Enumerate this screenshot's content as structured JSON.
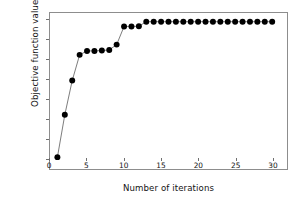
{
  "chart_data": {
    "type": "line",
    "title": "",
    "subtitle": "",
    "xlabel": "Number of iterations",
    "ylabel": "Objective function values",
    "xlim": [
      0,
      32
    ],
    "ylim": [
      0.2045,
      0.2835
    ],
    "xticks": [
      0,
      5,
      10,
      15,
      20,
      25,
      30
    ],
    "xticklabels": [
      "0",
      "5",
      "10",
      "15",
      "20",
      "25",
      "30"
    ],
    "yticks": [
      0.21,
      0.22,
      0.23,
      0.24,
      0.25,
      0.26,
      0.27,
      0.28
    ],
    "yticklabels": [
      "0.21",
      "0.22",
      "0.23",
      "0.24",
      "0.25",
      "0.26",
      "0.27",
      "0.28"
    ],
    "grid": false,
    "legend": false,
    "legend_position": "none",
    "marker": "filled-circle",
    "marker_color": "#000000",
    "line_color": "#5a5a5a",
    "x": [
      1,
      2,
      3,
      4,
      5,
      6,
      7,
      8,
      9,
      10,
      11,
      12,
      13,
      14,
      15,
      16,
      17,
      18,
      19,
      20,
      21,
      22,
      23,
      24,
      25,
      26,
      27,
      28,
      29,
      30
    ],
    "values": [
      0.2105,
      0.232,
      0.2493,
      0.2623,
      0.2643,
      0.2643,
      0.2645,
      0.2648,
      0.2675,
      0.2767,
      0.2767,
      0.2768,
      0.2791,
      0.2791,
      0.2791,
      0.2791,
      0.2791,
      0.2791,
      0.2791,
      0.2791,
      0.2791,
      0.2791,
      0.2791,
      0.2791,
      0.2791,
      0.2791,
      0.2791,
      0.2791,
      0.2791,
      0.2791
    ],
    "series": [
      {
        "name": "Objective function value",
        "values": [
          0.2105,
          0.232,
          0.2493,
          0.2623,
          0.2643,
          0.2643,
          0.2645,
          0.2648,
          0.2675,
          0.2767,
          0.2767,
          0.2768,
          0.2791,
          0.2791,
          0.2791,
          0.2791,
          0.2791,
          0.2791,
          0.2791,
          0.2791,
          0.2791,
          0.2791,
          0.2791,
          0.2791,
          0.2791,
          0.2791,
          0.2791,
          0.2791,
          0.2791,
          0.2791
        ]
      }
    ],
    "annotations": []
  }
}
